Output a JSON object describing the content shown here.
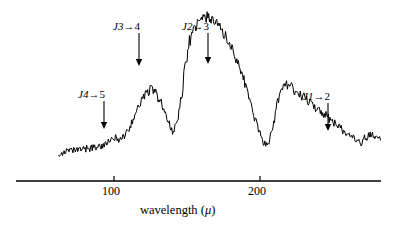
{
  "figure": {
    "background_color": "#ffffff",
    "ink_color": "#000000",
    "width": 398,
    "height": 228
  },
  "axis": {
    "title_text": "wavelength",
    "title_unit_open": "(",
    "title_unit_symbol": "μ",
    "title_unit_close": ")",
    "tick_labels": [
      "100",
      "200"
    ],
    "tick_values": [
      100,
      200
    ],
    "tick_pixels": [
      114,
      260
    ],
    "line_y_px": 181,
    "line_x_start_px": 16,
    "line_x_end_px": 381
  },
  "annotations": [
    {
      "name": "J4-to-5",
      "j": "J",
      "from": "4",
      "arrow": "→",
      "to": "5",
      "label_x_px": 78,
      "label_y_px": 88,
      "arrow_x_px": 104,
      "arrow_y_top_px": 101,
      "arrow_y_bottom_px": 129
    },
    {
      "name": "J3-to-4",
      "j": "J",
      "from": "3",
      "arrow": "→",
      "to": "4",
      "label_x_px": 113,
      "label_y_px": 20,
      "arrow_x_px": 139,
      "arrow_y_top_px": 33,
      "arrow_y_bottom_px": 66
    },
    {
      "name": "J2-to-3",
      "j": "J",
      "from": "2",
      "arrow": "→",
      "to": "3",
      "label_x_px": 182,
      "label_y_px": 20,
      "arrow_x_px": 208,
      "arrow_y_top_px": 33,
      "arrow_y_bottom_px": 64
    },
    {
      "name": "J1-to-2",
      "j": "J",
      "from": "1",
      "arrow": "→",
      "to": "2",
      "label_x_px": 303,
      "label_y_px": 90,
      "arrow_x_px": 328,
      "arrow_y_top_px": 103,
      "arrow_y_bottom_px": 131
    }
  ],
  "chart_data": {
    "type": "line",
    "title": "",
    "xlabel": "wavelength (μ)",
    "ylabel": "",
    "xlim": [
      62,
      283
    ],
    "ylim": [
      0,
      1
    ],
    "grid": false,
    "legend": null,
    "series": [
      {
        "name": "far-infrared emission spectrum",
        "noise_amplitude": 0.028,
        "comment": "x in microns, y in normalized intensity (1 = top of main peak)",
        "x": [
          62,
          66,
          70,
          74,
          78,
          82,
          86,
          90,
          94,
          98,
          101,
          104,
          107,
          110,
          113,
          116,
          119,
          122,
          125,
          128,
          131,
          134,
          137,
          140,
          143,
          146,
          149,
          152,
          155,
          158,
          161,
          164,
          167,
          170,
          173,
          176,
          179,
          182,
          185,
          188,
          191,
          194,
          197,
          200,
          203,
          206,
          209,
          212,
          215,
          218,
          221,
          224,
          227,
          230,
          233,
          236,
          239,
          242,
          245,
          248,
          251,
          254,
          257,
          260,
          263,
          266,
          269,
          272,
          275,
          278,
          281
        ],
        "y": [
          0.115,
          0.122,
          0.128,
          0.133,
          0.14,
          0.146,
          0.152,
          0.16,
          0.172,
          0.196,
          0.215,
          0.206,
          0.224,
          0.268,
          0.33,
          0.4,
          0.462,
          0.505,
          0.53,
          0.512,
          0.47,
          0.4,
          0.318,
          0.262,
          0.3,
          0.47,
          0.7,
          0.85,
          0.92,
          0.96,
          0.99,
          1.0,
          0.985,
          0.96,
          0.925,
          0.88,
          0.83,
          0.77,
          0.7,
          0.62,
          0.53,
          0.43,
          0.33,
          0.24,
          0.18,
          0.19,
          0.3,
          0.45,
          0.54,
          0.56,
          0.545,
          0.52,
          0.5,
          0.48,
          0.455,
          0.43,
          0.408,
          0.385,
          0.36,
          0.335,
          0.31,
          0.288,
          0.265,
          0.24,
          0.215,
          0.195,
          0.178,
          0.215,
          0.23,
          0.228,
          0.21
        ]
      }
    ],
    "absorption_features": [
      {
        "label": "J4→5",
        "wavelength": 100,
        "pixel_x": 104
      },
      {
        "label": "J3→4",
        "wavelength": 117,
        "pixel_x": 139
      },
      {
        "label": "J2→3",
        "wavelength": 164,
        "pixel_x": 208
      },
      {
        "label": "J1→2",
        "wavelength": 246,
        "pixel_x": 328
      }
    ]
  }
}
